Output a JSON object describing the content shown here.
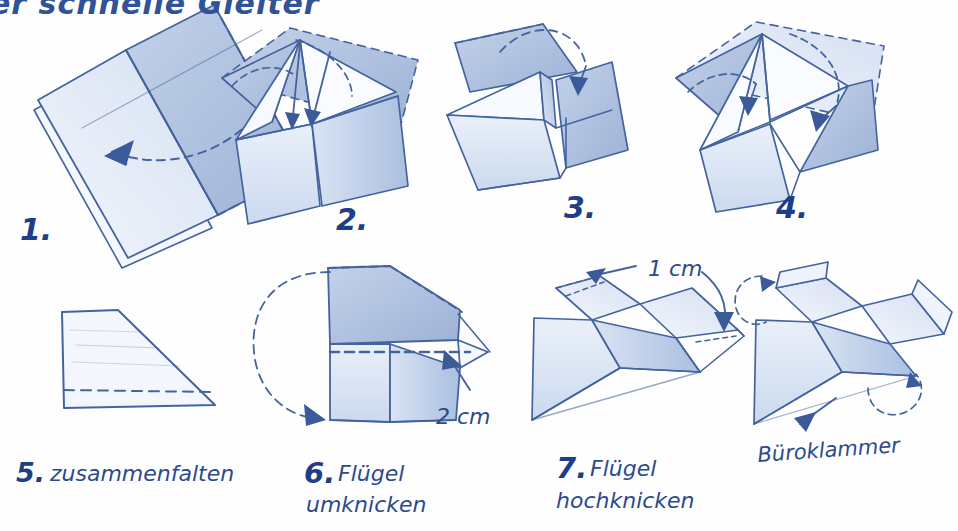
{
  "document": {
    "kind": "hand-drawn-instruction-sheet",
    "language": "de",
    "title_partial": "er schnelle Gleiter",
    "background_color": "#ffffff",
    "ink_color": "#2f5298",
    "ink_dark": "#1d3f87",
    "pencil_shade": "#b9c9e4"
  },
  "steps": [
    {
      "id": "step-1",
      "number": "1.",
      "caption": "",
      "illustration": "folded-sheet-with-center-crease",
      "arrow": "curved-fold-left"
    },
    {
      "id": "step-2",
      "number": "2.",
      "caption": "",
      "illustration": "corners-folded-to-center",
      "arrow": "two-straight-down-arrows"
    },
    {
      "id": "step-3",
      "number": "3.",
      "caption": "",
      "illustration": "top-flap-folding-down",
      "arrow": "dashed-arc-with-down-arrow"
    },
    {
      "id": "step-4",
      "number": "4.",
      "caption": "",
      "illustration": "upper-corners-to-middle",
      "arrow": "two-dashed-arcs"
    },
    {
      "id": "step-5",
      "number": "5.",
      "caption": "zusammenfalten",
      "illustration": "flat-wing-profile-with-dashed-crease",
      "arrow": "none"
    },
    {
      "id": "step-6",
      "number": "6.",
      "caption": "Flügel\numknicken",
      "caption_line1": "Flügel",
      "caption_line2": "umknicken",
      "illustration": "wing-folded-down-side-view",
      "arrow": "big-dashed-loop-left",
      "measure": "2 cm"
    },
    {
      "id": "step-7",
      "number": "7.",
      "caption": "Flügel\nhochknicken",
      "caption_line1": "Flügel",
      "caption_line2": "hochknicken",
      "illustration": "plane-perspective-with-wingtip-marks",
      "arrow": "two-arrows-top",
      "measure": "1 cm"
    },
    {
      "id": "step-8",
      "number": "",
      "caption": "Büroklammer",
      "illustration": "finished-plane-with-upturned-wingtips",
      "arrow": "arrow-pointing-to-nose"
    }
  ],
  "annotations": {
    "measure_2cm": "2 cm",
    "measure_1cm": "1 cm",
    "paperclip_label": "Büroklammer"
  }
}
